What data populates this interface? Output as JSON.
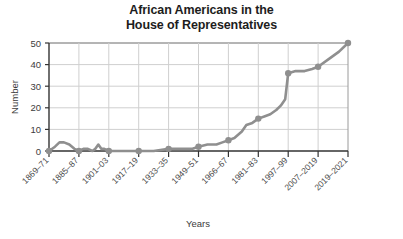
{
  "chart_data": {
    "type": "line",
    "title": "African Americans in the House of Representatives",
    "title_lines": [
      "African Americans in the",
      "House of Representatives"
    ],
    "xlabel": "Years",
    "ylabel": "Number",
    "ylim": [
      0,
      50
    ],
    "yticks": [
      0,
      10,
      20,
      30,
      40,
      50
    ],
    "ytick_labels": [
      "0",
      "10",
      "20",
      "30",
      "40",
      "50"
    ],
    "grid": true,
    "legend": "none",
    "line_color": "#8f8f8f",
    "marker_color": "#8f8f8f",
    "axis_color": "#333333",
    "grid_color": "#cccccc",
    "categories": [
      "1869-71",
      "1885-87",
      "1901-03",
      "1917-19",
      "1933-35",
      "1949-51",
      "1966-67",
      "1981-83",
      "1997-99",
      "2007-2019",
      "2019-2021"
    ],
    "xtick_labels": [
      "1869–71",
      "1885–87",
      "1901–03",
      "1917–19",
      "1933–35",
      "1949–51",
      "1966–67",
      "1981–83",
      "1997–99",
      "2007–2019",
      "2019–2021"
    ],
    "marker_values": [
      0,
      0,
      0,
      0,
      1,
      2,
      5,
      15,
      36,
      39,
      50
    ],
    "x": [
      0,
      1,
      2,
      3,
      4,
      5,
      6,
      7,
      8,
      9,
      10
    ],
    "values": [
      0,
      0,
      0,
      0,
      1,
      2,
      5,
      15,
      36,
      39,
      50
    ],
    "detail_series": {
      "note": "dense two-year-congress readings traced between labeled ticks",
      "points": [
        {
          "x": 0.0,
          "y": 0
        },
        {
          "x": 0.2,
          "y": 2
        },
        {
          "x": 0.35,
          "y": 4
        },
        {
          "x": 0.5,
          "y": 4
        },
        {
          "x": 0.68,
          "y": 3
        },
        {
          "x": 0.85,
          "y": 1
        },
        {
          "x": 1.0,
          "y": 0
        },
        {
          "x": 1.15,
          "y": 1
        },
        {
          "x": 1.3,
          "y": 1
        },
        {
          "x": 1.45,
          "y": 0
        },
        {
          "x": 1.55,
          "y": 1
        },
        {
          "x": 1.65,
          "y": 3
        },
        {
          "x": 1.75,
          "y": 1
        },
        {
          "x": 1.85,
          "y": 1
        },
        {
          "x": 2.0,
          "y": 0
        },
        {
          "x": 2.5,
          "y": 0
        },
        {
          "x": 3.0,
          "y": 0
        },
        {
          "x": 3.5,
          "y": 0
        },
        {
          "x": 4.0,
          "y": 1
        },
        {
          "x": 4.4,
          "y": 1
        },
        {
          "x": 4.8,
          "y": 1
        },
        {
          "x": 5.0,
          "y": 2
        },
        {
          "x": 5.3,
          "y": 3
        },
        {
          "x": 5.6,
          "y": 3
        },
        {
          "x": 5.8,
          "y": 4
        },
        {
          "x": 6.0,
          "y": 5
        },
        {
          "x": 6.2,
          "y": 6
        },
        {
          "x": 6.45,
          "y": 9
        },
        {
          "x": 6.6,
          "y": 12
        },
        {
          "x": 6.8,
          "y": 13
        },
        {
          "x": 7.0,
          "y": 15
        },
        {
          "x": 7.2,
          "y": 16
        },
        {
          "x": 7.4,
          "y": 17
        },
        {
          "x": 7.6,
          "y": 19
        },
        {
          "x": 7.75,
          "y": 21
        },
        {
          "x": 7.9,
          "y": 24
        },
        {
          "x": 8.0,
          "y": 36
        },
        {
          "x": 8.25,
          "y": 37
        },
        {
          "x": 8.55,
          "y": 37
        },
        {
          "x": 8.8,
          "y": 38
        },
        {
          "x": 9.0,
          "y": 39
        },
        {
          "x": 9.4,
          "y": 43
        },
        {
          "x": 9.7,
          "y": 46
        },
        {
          "x": 10.0,
          "y": 50
        }
      ]
    }
  }
}
